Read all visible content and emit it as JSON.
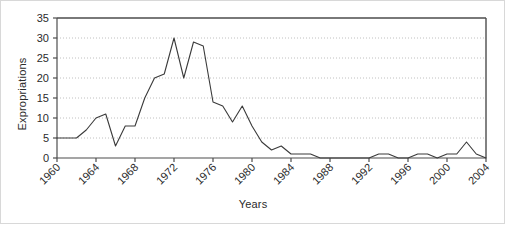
{
  "chart_data": {
    "type": "line",
    "title": "",
    "xlabel": "Years",
    "ylabel": "Expropriations",
    "ylim": [
      0,
      35
    ],
    "ytick_step": 5,
    "yticks": [
      "0",
      "5",
      "10",
      "15",
      "20",
      "25",
      "30",
      "35"
    ],
    "xlim": [
      1960,
      2004
    ],
    "xtick_step": 4,
    "xticks": [
      "1960",
      "1964",
      "1968",
      "1972",
      "1976",
      "1980",
      "1984",
      "1988",
      "1992",
      "1996",
      "2000",
      "2004"
    ],
    "grid": "horizontal-dotted",
    "legend": "none",
    "line_color": "#3a3a3a",
    "grid_color": "#b9b9b9",
    "axis_color": "#4d4d4d",
    "x": [
      1960,
      1961,
      1962,
      1963,
      1964,
      1965,
      1966,
      1967,
      1968,
      1969,
      1970,
      1971,
      1972,
      1973,
      1974,
      1975,
      1976,
      1977,
      1978,
      1979,
      1980,
      1981,
      1982,
      1983,
      1984,
      1985,
      1986,
      1987,
      1988,
      1989,
      1990,
      1991,
      1992,
      1993,
      1994,
      1995,
      1996,
      1997,
      1998,
      1999,
      2000,
      2001,
      2002,
      2003,
      2004
    ],
    "values": [
      5,
      5,
      5,
      7,
      10,
      11,
      3,
      8,
      8,
      15,
      20,
      21,
      30,
      20,
      29,
      28,
      14,
      13,
      9,
      13,
      8,
      4,
      2,
      3,
      1,
      1,
      1,
      0,
      0,
      0,
      0,
      0,
      0,
      1,
      1,
      0,
      0,
      1,
      1,
      0,
      1,
      1,
      4,
      1,
      0
    ]
  }
}
